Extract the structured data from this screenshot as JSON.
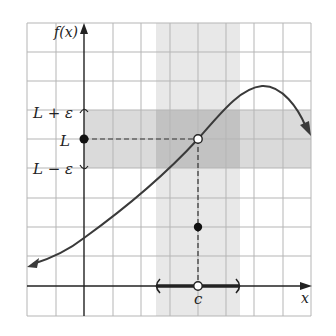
{
  "figure": {
    "y_axis_label": "f(x)",
    "x_axis_label": "x",
    "point_label_c": "c",
    "y_labels": {
      "upper": "L + ε",
      "middle": "L",
      "lower": "L − ε"
    },
    "colors": {
      "grid": "#b8b8b8",
      "band_light": "#e6e6e6",
      "band_overlap": "#c4c4c4",
      "curve": "#3a3a3a",
      "axis": "#222222"
    },
    "points": {
      "open_circle": {
        "x": "c",
        "y": "L"
      },
      "filled_point_on_y_axis": {
        "y": "L"
      },
      "filled_point_below": {
        "x": "c",
        "y": "f(c)"
      },
      "open_circle_on_x_axis": {
        "x": "c"
      }
    },
    "interval_on_x_axis": "(c − δ, c + δ)"
  }
}
